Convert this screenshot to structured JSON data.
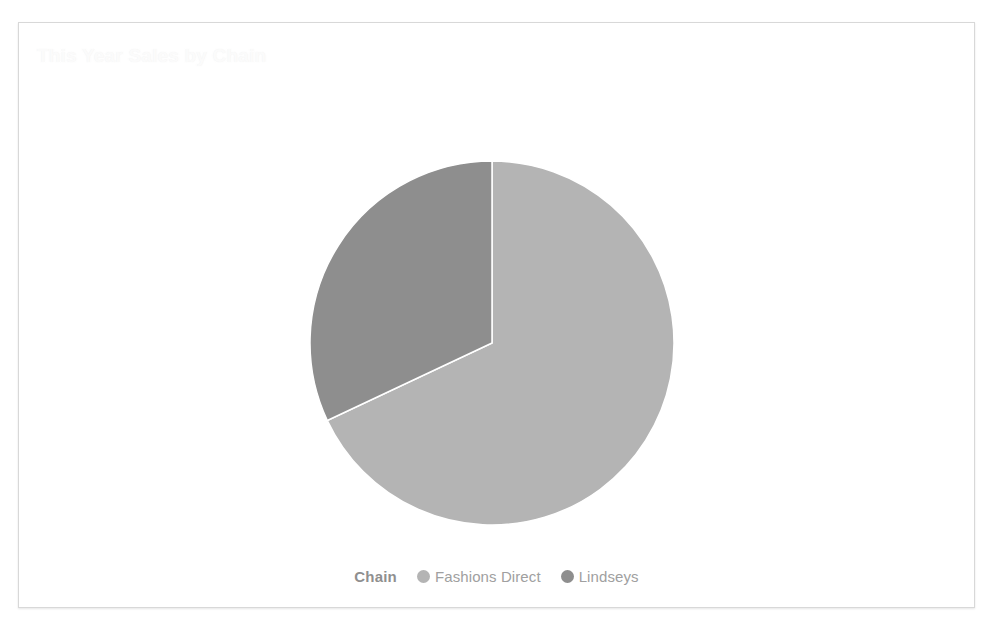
{
  "card": {
    "border_color": "#d8d8d8",
    "background": "#ffffff"
  },
  "header": {
    "title": "This Year Sales by Chain",
    "title_color": "#fbfbfb"
  },
  "legend": {
    "title": "Chain",
    "position": "bottom",
    "items": [
      {
        "label": "Fashions Direct",
        "color": "#b4b4b4"
      },
      {
        "label": "Lindseys",
        "color": "#8e8e8e"
      }
    ]
  },
  "chart_data": {
    "type": "pie",
    "title": "This Year Sales by Chain",
    "xlabel": "",
    "ylabel": "",
    "legend_title": "Chain",
    "legend_position": "bottom",
    "grid": false,
    "categories": [
      "Fashions Direct",
      "Lindseys"
    ],
    "values": [
      68,
      32
    ],
    "units": "percent",
    "colors": [
      "#b4b4b4",
      "#8e8e8e"
    ],
    "start_angle_deg": 0,
    "direction": "clockwise",
    "slices": [
      {
        "name": "Fashions Direct",
        "value": 68,
        "percent": 68,
        "color": "#b4b4b4",
        "start_angle_deg": 0,
        "end_angle_deg": 244.8
      },
      {
        "name": "Lindseys",
        "value": 32,
        "percent": 32,
        "color": "#8e8e8e",
        "start_angle_deg": 244.8,
        "end_angle_deg": 360
      }
    ]
  }
}
